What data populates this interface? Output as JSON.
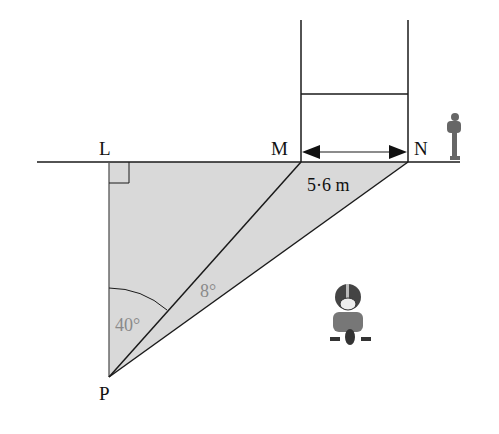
{
  "diagram": {
    "points": {
      "L": "L",
      "M": "M",
      "N": "N",
      "P": "P"
    },
    "distance_label": "5·6 m",
    "angle_LPM": "40°",
    "angle_MPN": "8°",
    "colors": {
      "shade": "#d9d9d9",
      "line": "#1a1a1a",
      "angle_text": "#8a8a8a"
    }
  }
}
